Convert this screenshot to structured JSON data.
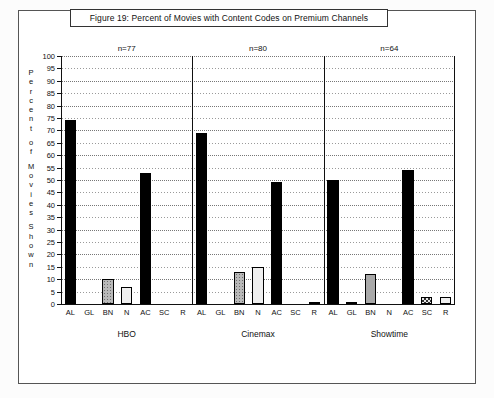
{
  "figure": {
    "title": "Figure 19:  Percent of Movies with Content Codes on Premium Channels",
    "ylabel_chars": [
      "P",
      "e",
      "r",
      "c",
      "e",
      "n",
      "t",
      "",
      "o",
      "f",
      "",
      "M",
      "o",
      "v",
      "i",
      "e",
      "s",
      "",
      "S",
      "h",
      "o",
      "w",
      "n"
    ]
  },
  "chart_data": {
    "type": "bar",
    "title": "Figure 19:  Percent of Movies with Content Codes on Premium Channels",
    "xlabel": "",
    "ylabel": "Percent of Movies Shown",
    "ylim": [
      0,
      100
    ],
    "ytick_step": 5,
    "yticks": [
      0,
      5,
      10,
      15,
      20,
      25,
      30,
      35,
      40,
      45,
      50,
      55,
      60,
      65,
      70,
      75,
      80,
      85,
      90,
      95,
      100
    ],
    "grid": true,
    "legend": "none",
    "categories": [
      "AL",
      "GL",
      "BN",
      "N",
      "AC",
      "SC",
      "R"
    ],
    "groups": [
      {
        "name": "HBO",
        "n_label": "n=77",
        "values": [
          74,
          0,
          10,
          7,
          53,
          0,
          0
        ],
        "fills": [
          "black",
          "none",
          "dotgray",
          "light",
          "black",
          "none",
          "none"
        ]
      },
      {
        "name": "Cinemax",
        "n_label": "n=80",
        "values": [
          69,
          0,
          13,
          15,
          49,
          0,
          1
        ],
        "fills": [
          "black",
          "none",
          "dotgray",
          "light",
          "black",
          "none",
          "midgray"
        ]
      },
      {
        "name": "Showtime",
        "n_label": "n=64",
        "values": [
          50,
          1,
          12,
          0,
          54,
          3,
          3
        ],
        "fills": [
          "black",
          "black",
          "midgray",
          "none",
          "black",
          "check",
          "light"
        ]
      }
    ]
  }
}
